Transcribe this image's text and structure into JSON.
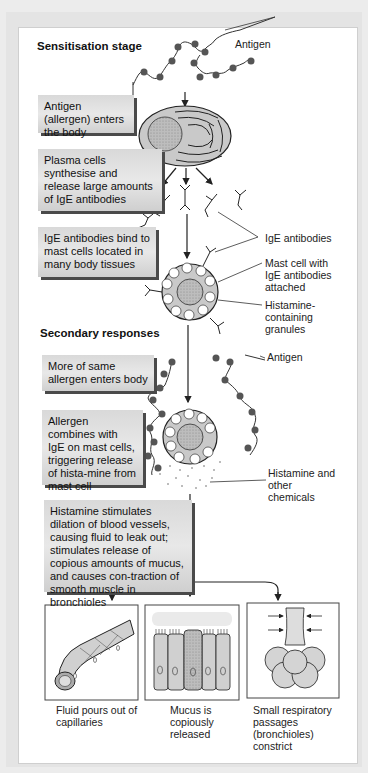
{
  "stages": {
    "sensitisation": "Sensitisation stage",
    "secondary": "Secondary responses"
  },
  "boxes": {
    "antigen_enters": "Antigen (allergen) enters the body",
    "plasma_cells": "Plasma cells synthesise and release large amounts of IgE antibodies",
    "ige_bind": "IgE antibodies bind to mast cells located in many body tissues",
    "more_allergen": "More of same allergen enters body",
    "allergen_combines": "Allergen combines with IgE on mast cells, triggering release of hista-mine from mast cell",
    "histamine_effects": "Histamine stimulates dilation of blood vessels, causing fluid to leak out; stimulates release of copious amounts of mucus, and causes con-traction of smooth muscle in bronchioles"
  },
  "labels": {
    "antigen_top": "Antigen",
    "ige_antibodies": "IgE antibodies",
    "mast_cell": "Mast cell with IgE antibodies attached",
    "granules": "Histamine-containing granules",
    "antigen_secondary": "Antigen",
    "histamine_chem": "Histamine and other chemicals"
  },
  "outcomes": [
    {
      "caption": "Fluid pours out of capillaries",
      "icon": "capillary-icon"
    },
    {
      "caption": "Mucus is copiously released",
      "icon": "mucus-cells-icon"
    },
    {
      "caption": "Small respiratory passages (bronchioles) constrict",
      "icon": "bronchiole-icon"
    }
  ],
  "colors": {
    "box_fill": "#dcdcdc",
    "box_shadow": "#4a4a4a",
    "cell_fill": "#c9c9c9",
    "antigen_dot": "#555555",
    "line": "#222222"
  }
}
